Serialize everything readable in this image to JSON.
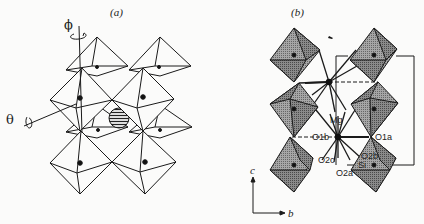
{
  "figure": {
    "panel_a": {
      "label": "(a)",
      "rotation_axes": {
        "phi": "ϕ",
        "theta": "θ"
      },
      "description": "Perovskite-type framework of corner-sharing octahedra with A-site cation (hatched sphere)"
    },
    "panel_b": {
      "label": "(b)",
      "atom_labels": {
        "mg": "Mg",
        "o1b": "O1b",
        "o1a": "O1a",
        "o2c": "O2c",
        "o2b": "O2b",
        "o2a": "O2a",
        "si": "Si"
      },
      "axes": {
        "c": "c",
        "b": "b"
      },
      "description": "Tilted SiO6 octahedra with Mg site coordination"
    }
  },
  "colors": {
    "line": "#1a1a1a",
    "octa_face_light": "#9a9a9a",
    "octa_face_dark": "#6e6e6e",
    "background": "#fbfbfa"
  }
}
